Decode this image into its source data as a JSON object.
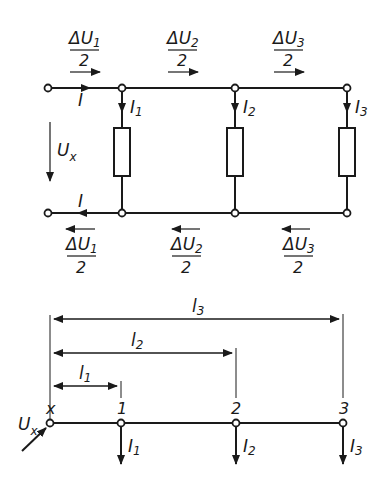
{
  "colors": {
    "ink": "#1a1a1a",
    "background": "#ffffff"
  },
  "circuit": {
    "current_label": "I",
    "voltage_label": "U",
    "voltage_sub": "x",
    "branches": [
      {
        "current": "I",
        "sub": "1",
        "drop_top": "ΔU",
        "drop_sub": "1",
        "denominator": "2"
      },
      {
        "current": "I",
        "sub": "2",
        "drop_top": "ΔU",
        "drop_sub": "2",
        "denominator": "2"
      },
      {
        "current": "I",
        "sub": "3",
        "drop_top": "ΔU",
        "drop_sub": "3",
        "denominator": "2"
      }
    ]
  },
  "line_model": {
    "source_label": "U",
    "source_sub": "x",
    "points": [
      "x",
      "1",
      "2",
      "3"
    ],
    "loads": [
      {
        "label": "I",
        "sub": "1"
      },
      {
        "label": "I",
        "sub": "2"
      },
      {
        "label": "I",
        "sub": "3"
      }
    ],
    "dimensions": [
      {
        "label": "l",
        "sub": "1"
      },
      {
        "label": "l",
        "sub": "2"
      },
      {
        "label": "l",
        "sub": "3"
      }
    ]
  }
}
